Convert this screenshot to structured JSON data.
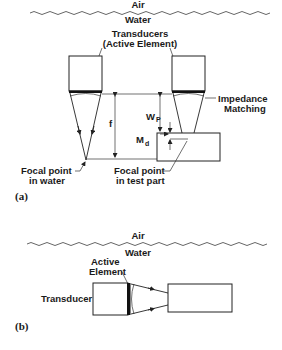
{
  "figure_a": {
    "medium_top": "Air",
    "medium_bottom": "Water",
    "transducers_label_line1": "Transducers",
    "transducers_label_line2": "(Active Element)",
    "impedance_label_line1": "Impedance",
    "impedance_label_line2": "Matching",
    "f_label": "f",
    "wp_label": "W",
    "wp_sub": "P",
    "md_label": "M",
    "md_sub": "d",
    "focal_water_line1": "Focal point",
    "focal_water_line2": "in water",
    "focal_part_line1": "Focal point",
    "focal_part_line2": "in test part",
    "panel_label": "(a)"
  },
  "figure_b": {
    "medium_top": "Air",
    "medium_bottom": "Water",
    "active_element_line1": "Active",
    "active_element_line2": "Element",
    "transducer_label": "Transducer",
    "panel_label": "(b)"
  },
  "colors": {
    "stroke": "#222222",
    "background": "#ffffff"
  }
}
